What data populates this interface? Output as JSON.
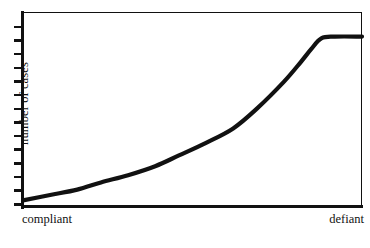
{
  "chart_data": {
    "type": "line",
    "title": "",
    "subtitle": "",
    "xlabel": "",
    "ylabel": "number of cases",
    "x_tick_labels": [
      "compliant",
      "defiant"
    ],
    "y_tick_labels": [],
    "grid": false,
    "legend": null,
    "axis_style": "box-frame-with-outward-y-ticks",
    "y_tick_count": 14,
    "xlim": [
      0,
      1
    ],
    "ylim": [
      0,
      1
    ],
    "annotations": [],
    "series": [
      {
        "name": "cases",
        "description": "slow exponential rise from compliant end, steepening, then plateau near defiant end",
        "x": [
          0.0,
          0.08,
          0.16,
          0.23,
          0.31,
          0.39,
          0.46,
          0.54,
          0.62,
          0.69,
          0.77,
          0.82,
          0.85,
          0.88,
          0.92,
          1.0
        ],
        "y": [
          0.02,
          0.05,
          0.08,
          0.12,
          0.16,
          0.21,
          0.27,
          0.34,
          0.42,
          0.53,
          0.68,
          0.79,
          0.86,
          0.92,
          0.93,
          0.93
        ]
      }
    ]
  },
  "axis": {
    "y_label": "number of cases",
    "x_left_label": "compliant",
    "x_right_label": "defiant"
  },
  "style": {
    "ink": "#111111",
    "background": "#ffffff",
    "curve_width_px": 4.2,
    "frame_width_px": 1.5
  }
}
